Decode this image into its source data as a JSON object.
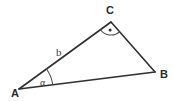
{
  "diagram": {
    "kind": "right-triangle",
    "background_color": "#ffffff",
    "stroke_color": "#2f2f2f",
    "label_color": "#2b2b2b",
    "vertices": [
      {
        "name": "A",
        "label": "A",
        "x": 19,
        "y": 89,
        "label_x": 11,
        "label_y": 97
      },
      {
        "name": "B",
        "label": "B",
        "x": 155,
        "y": 72,
        "label_x": 160,
        "label_y": 78
      },
      {
        "name": "C",
        "label": "C",
        "x": 111,
        "y": 22,
        "label_x": 106,
        "label_y": 14
      }
    ],
    "sides": [
      {
        "name": "side-ab",
        "from": "A",
        "to": "B",
        "label": ""
      },
      {
        "name": "side-bc",
        "from": "B",
        "to": "C",
        "label": ""
      },
      {
        "name": "side-ca",
        "from": "C",
        "to": "A",
        "label": "b",
        "label_x": 56,
        "label_y": 56
      }
    ],
    "angles": [
      {
        "name": "angle-alpha-at-a",
        "at": "A",
        "label": "α",
        "label_x": 40,
        "label_y": 86,
        "marker": "arc"
      },
      {
        "name": "right-angle-at-c",
        "at": "C",
        "label": "",
        "marker": "arc-with-dot"
      }
    ]
  }
}
